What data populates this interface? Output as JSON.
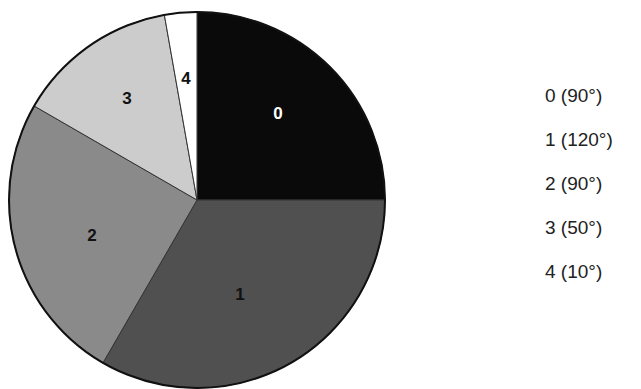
{
  "chart_data": {
    "type": "pie",
    "title": "",
    "unit": "degrees",
    "start_angle_deg": 90,
    "direction": "clockwise",
    "categories": [
      "0",
      "1",
      "2",
      "3",
      "4"
    ],
    "values": [
      90,
      120,
      90,
      50,
      10
    ],
    "colors": [
      "#0a0a0a",
      "#505050",
      "#8a8a8a",
      "#cccccc",
      "#ffffff"
    ],
    "label_colors": [
      "#ffffff",
      "#111111",
      "#111111",
      "#111111",
      "#111111"
    ],
    "legend": [
      "0 (90°)",
      "1 (120°)",
      "2 (90°)",
      "3 (50°)",
      "4 (10°)"
    ],
    "legend_position": "right"
  },
  "pie": {
    "center": [
      197,
      200
    ],
    "radius": 188,
    "labels": [
      {
        "text": "0",
        "x": 278,
        "y": 119
      },
      {
        "text": "1",
        "x": 240,
        "y": 300
      },
      {
        "text": "2",
        "x": 92,
        "y": 241
      },
      {
        "text": "3",
        "x": 127,
        "y": 104
      },
      {
        "text": "4",
        "x": 186,
        "y": 84
      }
    ]
  },
  "legend": {
    "items": [
      "0 (90°)",
      "1 (120°)",
      "2 (90°)",
      "3 (50°)",
      "4 (10°)"
    ]
  }
}
